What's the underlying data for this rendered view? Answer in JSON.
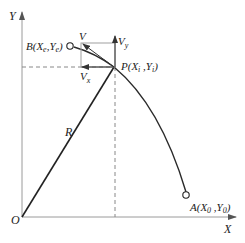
{
  "diagram": {
    "colors": {
      "axis": "#9a9a9a",
      "curve": "#2a2a2a",
      "radius": "#222222",
      "dashed": "#888888",
      "box": "#a0a0a0",
      "arrow": "#333333",
      "text": "#222222"
    },
    "axes": {
      "y_label": "Y",
      "x_label": "X",
      "origin_label": "O"
    },
    "points": {
      "B": {
        "label": "B(X",
        "sub1": "e",
        "mid": ",Y",
        "sub2": "e",
        "end": ")"
      },
      "P": {
        "label": "P(X",
        "sub1": "i",
        "mid": " ,Y",
        "sub2": "i",
        "end": ")"
      },
      "A": {
        "label": "A(X",
        "sub1": "0",
        "mid": " ,Y",
        "sub2": "0",
        "end": ")"
      }
    },
    "vectors": {
      "V": "V",
      "Vx": {
        "base": "V",
        "sub": "x"
      },
      "Vy": {
        "base": "V",
        "sub": "y"
      }
    },
    "radius_label": "R"
  }
}
